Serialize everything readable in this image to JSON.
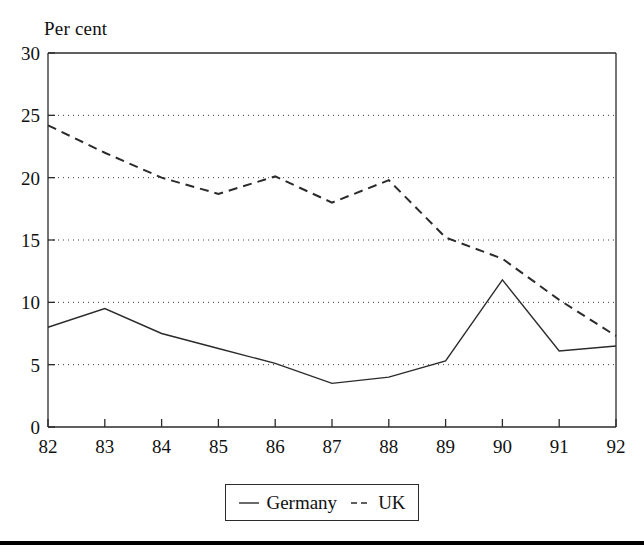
{
  "chart_data": {
    "type": "line",
    "title": "",
    "ylabel": "Per cent",
    "xlabel": "",
    "categories": [
      "82",
      "83",
      "84",
      "85",
      "86",
      "87",
      "88",
      "89",
      "90",
      "91",
      "92"
    ],
    "x": [
      82,
      83,
      84,
      85,
      86,
      87,
      88,
      89,
      90,
      91,
      92
    ],
    "series": [
      {
        "name": "Germany",
        "style": "solid",
        "color": "#2b2b2b",
        "values": [
          8.0,
          9.5,
          7.5,
          6.3,
          5.1,
          3.5,
          4.0,
          5.3,
          11.8,
          6.1,
          6.5
        ]
      },
      {
        "name": "UK",
        "style": "dashed",
        "color": "#2b2b2b",
        "values": [
          24.2,
          22.0,
          20.0,
          18.7,
          20.1,
          18.0,
          19.8,
          15.2,
          13.5,
          10.2,
          7.3
        ]
      }
    ],
    "ylim": [
      0,
      30
    ],
    "yticks": [
      0,
      5,
      10,
      15,
      20,
      25,
      30
    ],
    "ytick_labels": [
      "0",
      "5",
      "10",
      "15",
      "20",
      "25",
      "30"
    ],
    "xtick_labels": [
      "82",
      "83",
      "84",
      "85",
      "86",
      "87",
      "88",
      "89",
      "90",
      "91",
      "92"
    ],
    "grid": "horizontal-dotted",
    "legend_position": "bottom-center",
    "legend_entries": [
      "Germany",
      "UK"
    ]
  },
  "legend": {
    "germany_label": "Germany",
    "uk_label": "UK"
  },
  "labels": {
    "y_axis_title": "Per cent"
  }
}
